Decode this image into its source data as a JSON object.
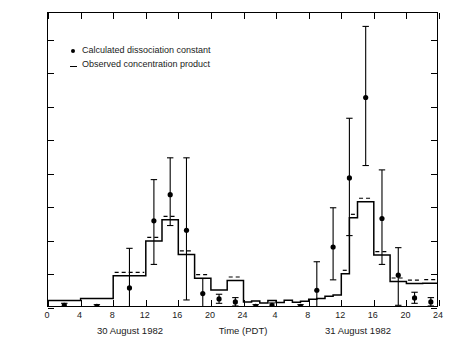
{
  "axes": {
    "y_ticks": [
      0,
      100,
      200,
      300,
      400,
      500,
      600,
      700,
      800
    ],
    "y_title_html": "[HNO<sub>3(g)</sub>] &times; [NH<sub>3(g)</sub>] (ppb<sup>2</sup>)",
    "x_ticks": [
      0,
      4,
      8,
      12,
      16,
      20,
      24,
      4,
      8,
      12,
      16,
      20,
      24
    ],
    "x_title": "Time (PDT)",
    "day1_label": "30 August 1982",
    "day2_label": "31 August 1982"
  },
  "legend": [
    {
      "symbol": "filled-circle",
      "label": "Calculated dissociation constant"
    },
    {
      "symbol": "dash",
      "label": "Observed concentration product"
    }
  ],
  "chart_data": {
    "type": "line",
    "title": "",
    "xlabel": "Time (PDT)",
    "ylabel": "[HNO3(g)] x [NH3(g)] (ppb^2)",
    "xlim": [
      0,
      48
    ],
    "ylim": [
      0,
      880
    ],
    "grid": false,
    "legend_position": "upper-left",
    "x_unit": "hours from 00:00 on 30 August 1982",
    "series": [
      {
        "name": "Calculated dissociation constant",
        "type": "scatter-with-errorbars",
        "marker": "filled-circle",
        "x": [
          2,
          6,
          10,
          13,
          15,
          17,
          19,
          21,
          23,
          25.5,
          27.5,
          31,
          33,
          35,
          37,
          39,
          41,
          43,
          45,
          47
        ],
        "y": [
          8,
          5,
          60,
          260,
          338,
          232,
          43,
          27,
          18,
          5,
          8,
          5,
          53,
          182,
          388,
          628,
          267,
          98,
          30,
          18
        ],
        "yerr_low": [
          5,
          4,
          58,
          130,
          92,
          208,
          40,
          13,
          12,
          4,
          6,
          4,
          50,
          98,
          172,
          203,
          137,
          90,
          16,
          12
        ],
        "yerr_high": [
          6,
          5,
          118,
          123,
          110,
          216,
          45,
          14,
          13,
          5,
          7,
          5,
          85,
          117,
          178,
          212,
          145,
          82,
          17,
          13
        ]
      },
      {
        "name": "Observed concentration product",
        "type": "step",
        "x_edges": [
          0,
          4,
          8,
          12,
          14,
          16,
          18,
          20,
          22,
          24,
          25,
          26,
          27,
          28,
          29,
          30,
          31,
          32,
          33,
          34,
          35,
          36,
          37,
          38,
          40,
          42,
          44,
          46,
          48
        ],
        "values": [
          22,
          28,
          96,
          200,
          263,
          160,
          89,
          54,
          82,
          18,
          21,
          15,
          22,
          16,
          23,
          17,
          20,
          26,
          28,
          35,
          39,
          102,
          269,
          317,
          158,
          79,
          73,
          74
        ]
      }
    ]
  }
}
